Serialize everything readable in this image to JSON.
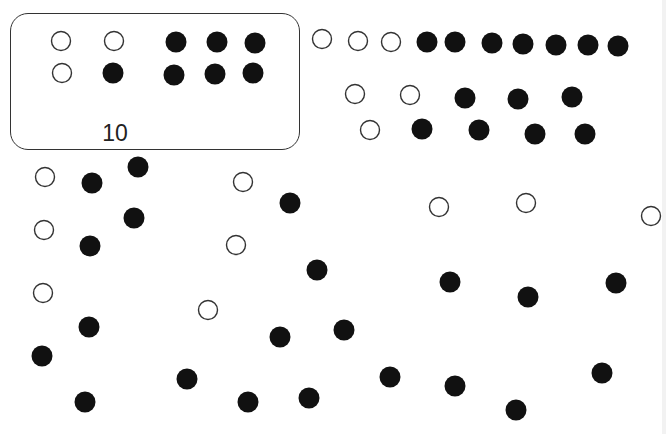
{
  "box": {
    "label": "10",
    "circles": [
      {
        "x": 61,
        "y": 41,
        "filled": false
      },
      {
        "x": 114,
        "y": 41,
        "filled": false
      },
      {
        "x": 62,
        "y": 73,
        "filled": false
      },
      {
        "x": 113,
        "y": 73,
        "filled": true
      },
      {
        "x": 176,
        "y": 42,
        "filled": true
      },
      {
        "x": 217,
        "y": 42,
        "filled": true
      },
      {
        "x": 255,
        "y": 43,
        "filled": true
      },
      {
        "x": 174,
        "y": 75,
        "filled": true
      },
      {
        "x": 215,
        "y": 74,
        "filled": true
      },
      {
        "x": 253,
        "y": 73,
        "filled": true
      }
    ]
  },
  "rows": [
    {
      "x": 322,
      "y": 39,
      "filled": false
    },
    {
      "x": 358,
      "y": 41,
      "filled": false
    },
    {
      "x": 391,
      "y": 42,
      "filled": false
    },
    {
      "x": 427,
      "y": 42,
      "filled": true
    },
    {
      "x": 455,
      "y": 42,
      "filled": true
    },
    {
      "x": 492,
      "y": 43,
      "filled": true
    },
    {
      "x": 523,
      "y": 44,
      "filled": true
    },
    {
      "x": 556,
      "y": 45,
      "filled": true
    },
    {
      "x": 588,
      "y": 45,
      "filled": true
    },
    {
      "x": 618,
      "y": 46,
      "filled": true
    },
    {
      "x": 355,
      "y": 94,
      "filled": false
    },
    {
      "x": 410,
      "y": 95,
      "filled": false
    },
    {
      "x": 465,
      "y": 98,
      "filled": true
    },
    {
      "x": 518,
      "y": 99,
      "filled": true
    },
    {
      "x": 572,
      "y": 97,
      "filled": true
    },
    {
      "x": 370,
      "y": 130,
      "filled": false
    },
    {
      "x": 422,
      "y": 129,
      "filled": true
    },
    {
      "x": 479,
      "y": 130,
      "filled": true
    },
    {
      "x": 535,
      "y": 134,
      "filled": true
    },
    {
      "x": 585,
      "y": 134,
      "filled": true
    }
  ],
  "scattered": [
    {
      "x": 45,
      "y": 177,
      "filled": false
    },
    {
      "x": 92,
      "y": 183,
      "filled": true
    },
    {
      "x": 138,
      "y": 167,
      "filled": true
    },
    {
      "x": 243,
      "y": 182,
      "filled": false
    },
    {
      "x": 290,
      "y": 203,
      "filled": true
    },
    {
      "x": 44,
      "y": 230,
      "filled": false
    },
    {
      "x": 134,
      "y": 218,
      "filled": true
    },
    {
      "x": 90,
      "y": 246,
      "filled": true
    },
    {
      "x": 236,
      "y": 245,
      "filled": false
    },
    {
      "x": 317,
      "y": 270,
      "filled": true
    },
    {
      "x": 43,
      "y": 293,
      "filled": false
    },
    {
      "x": 208,
      "y": 310,
      "filled": false
    },
    {
      "x": 89,
      "y": 327,
      "filled": true
    },
    {
      "x": 42,
      "y": 356,
      "filled": true
    },
    {
      "x": 280,
      "y": 337,
      "filled": true
    },
    {
      "x": 344,
      "y": 330,
      "filled": true
    },
    {
      "x": 187,
      "y": 379,
      "filled": true
    },
    {
      "x": 85,
      "y": 402,
      "filled": true
    },
    {
      "x": 248,
      "y": 402,
      "filled": true
    },
    {
      "x": 309,
      "y": 398,
      "filled": true
    },
    {
      "x": 439,
      "y": 207,
      "filled": false
    },
    {
      "x": 526,
      "y": 203,
      "filled": false
    },
    {
      "x": 651,
      "y": 216,
      "filled": false
    },
    {
      "x": 450,
      "y": 282,
      "filled": true
    },
    {
      "x": 528,
      "y": 297,
      "filled": true
    },
    {
      "x": 616,
      "y": 283,
      "filled": true
    },
    {
      "x": 390,
      "y": 377,
      "filled": true
    },
    {
      "x": 455,
      "y": 386,
      "filled": true
    },
    {
      "x": 516,
      "y": 410,
      "filled": true
    },
    {
      "x": 602,
      "y": 373,
      "filled": true
    }
  ],
  "colors": {
    "filled": "#111111",
    "outline": "#333333",
    "background": "#ffffff"
  }
}
